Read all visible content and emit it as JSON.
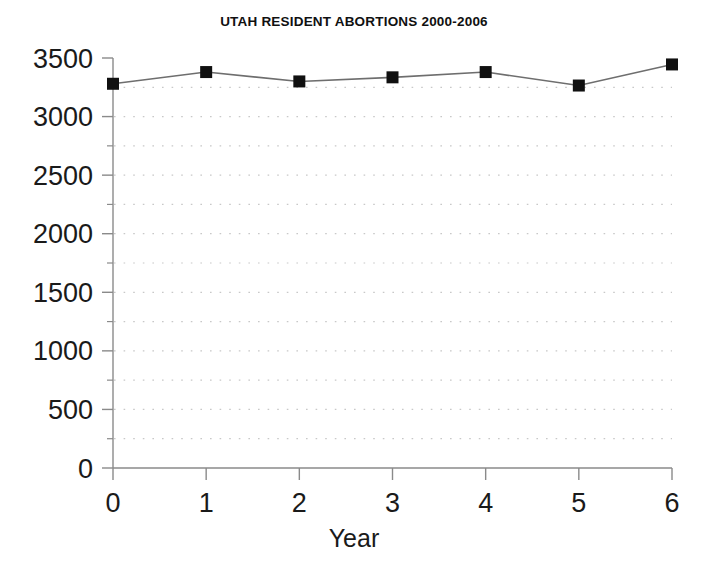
{
  "chart_data": {
    "type": "line",
    "title": "UTAH RESIDENT ABORTIONS 2000-2006",
    "xlabel": "Year",
    "ylabel": "",
    "x": [
      0,
      1,
      2,
      3,
      4,
      5,
      6
    ],
    "values": [
      3280,
      3380,
      3300,
      3335,
      3380,
      3265,
      3445
    ],
    "categories": [
      "0",
      "1",
      "2",
      "3",
      "4",
      "5",
      "6"
    ],
    "series": [
      {
        "name": "Utah resident abortions",
        "values": [
          3280,
          3380,
          3300,
          3335,
          3380,
          3265,
          3445
        ]
      }
    ],
    "xlim": [
      0,
      6
    ],
    "ylim": [
      0,
      3500
    ],
    "y_ticks": [
      0,
      500,
      1000,
      1500,
      2000,
      2500,
      3000,
      3500
    ],
    "y_tick_labels": [
      "0",
      "500",
      "1000",
      "1500",
      "2000",
      "2500",
      "3000",
      "3500"
    ],
    "y_minor_ticks": [
      250,
      750,
      1250,
      1750,
      2250,
      2750,
      3250
    ],
    "x_ticks": [
      0,
      1,
      2,
      3,
      4,
      5,
      6
    ],
    "x_tick_labels": [
      "0",
      "1",
      "2",
      "3",
      "4",
      "5",
      "6"
    ],
    "grid": true,
    "grid_style": "dotted",
    "grid_axis": "y",
    "legend": false,
    "legend_position": "none",
    "marker": "square",
    "marker_color": "#101010",
    "line_color": "#6e6e6e",
    "grid_color": "#c8c8c8",
    "axis_color": "#8a8a8a",
    "background": "#ffffff"
  },
  "axes": {
    "y_label_texts": [
      "3500",
      "3000",
      "2500",
      "2000",
      "1500",
      "1000",
      "500",
      "0"
    ],
    "x_label_texts": [
      "0",
      "1",
      "2",
      "3",
      "4",
      "5",
      "6"
    ]
  }
}
